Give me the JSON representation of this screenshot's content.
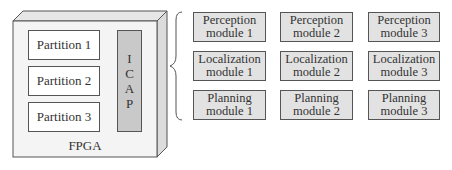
{
  "fpga": {
    "label": "FPGA",
    "partitions": [
      {
        "label": "Partition 1"
      },
      {
        "label": "Partition 2"
      },
      {
        "label": "Partition 3"
      }
    ],
    "icap": {
      "letters": [
        "I",
        "C",
        "A",
        "P"
      ]
    }
  },
  "modules": {
    "rows": [
      [
        {
          "line1": "Perception",
          "line2": "module 1"
        },
        {
          "line1": "Perception",
          "line2": "module 2"
        },
        {
          "line1": "Perception",
          "line2": "module 3"
        }
      ],
      [
        {
          "line1": "Localization",
          "line2": "module 1"
        },
        {
          "line1": "Localization",
          "line2": "module 2"
        },
        {
          "line1": "Localization",
          "line2": "module 3"
        }
      ],
      [
        {
          "line1": "Planning",
          "line2": "module 1"
        },
        {
          "line1": "Planning",
          "line2": "module 2"
        },
        {
          "line1": "Planning",
          "line2": "module 3"
        }
      ]
    ]
  },
  "colors": {
    "fpga_face": "#f4f4f4",
    "fpga_top": "#e6e6e6",
    "fpga_side": "#dcdcdc",
    "icap_fill": "#c9c9c9",
    "module_fill": "#e2e2e2",
    "stroke": "#555555"
  }
}
